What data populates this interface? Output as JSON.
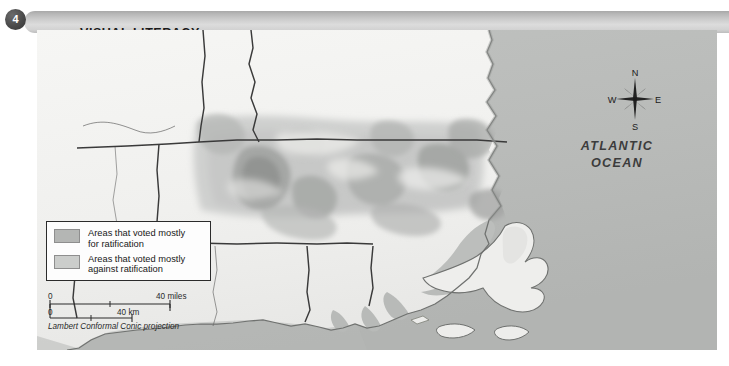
{
  "header": {
    "badge_number": "4",
    "title": "VISUAL LITERACY"
  },
  "map": {
    "ocean_label_line1": "ATLANTIC",
    "ocean_label_line2": "OCEAN",
    "colors": {
      "ocean": "#bbbdbb",
      "land": "#f3f3f1",
      "vote_for_shade": "#b4b6b4",
      "vote_against_shade": "#cbcdcb",
      "state_border": "#3a3a3a",
      "coastline": "#6f716f",
      "page_background": "#ffffff",
      "badge": "#3d3d3d",
      "header_gradient_top": "#a8a8a8",
      "header_gradient_mid": "#dcdcdc",
      "header_gradient_bottom": "#bdbdbd"
    }
  },
  "legend": {
    "items": [
      {
        "swatch_name": "vote-for",
        "label": "Areas that voted mostly\nfor ratification"
      },
      {
        "swatch_name": "vote-against",
        "label": "Areas that voted mostly\nagainst ratification"
      }
    ]
  },
  "scale": {
    "miles_zero": "0",
    "miles_max": "40 miles",
    "km_zero": "0",
    "km_max": "40 km",
    "projection": "Lambert Conformal Conic projection"
  },
  "compass": {
    "north": "N",
    "south": "S",
    "west": "W",
    "east": "E"
  }
}
